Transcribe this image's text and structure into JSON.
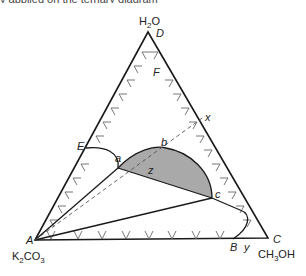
{
  "header": {
    "cut_off_text": "y applied on the ternary diagram"
  },
  "diagram": {
    "type": "ternary-phase-diagram",
    "vertices": {
      "top": {
        "formula_main": "H",
        "formula_sub": "2",
        "formula_tail": "O",
        "point_label": "D"
      },
      "bottom_left": {
        "formula_main": "K",
        "formula_sub": "2",
        "formula_tail": "CO",
        "formula_sub2": "3",
        "point_label": "A"
      },
      "bottom_right": {
        "formula_main": "CH",
        "formula_sub": "3",
        "formula_tail": "OH",
        "point_label": "C"
      }
    },
    "point_labels": {
      "E": "E",
      "F": "F",
      "a": "a",
      "b": "b",
      "c": "c",
      "x": "x",
      "z": "z",
      "B": "B",
      "y": "y"
    },
    "colors": {
      "line": "#1a1a1a",
      "two_phase_fill": "#a9a9a9",
      "tick": "#555555",
      "dashed": "#555555"
    }
  }
}
